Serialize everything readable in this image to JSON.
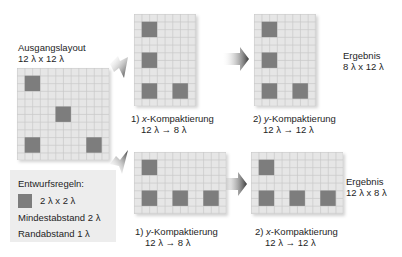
{
  "colors": {
    "grid_background": "#e6e6e6",
    "grid_line": "#c9c9c9",
    "block": "#7d7d7d",
    "rules_box": "#ededed",
    "arrow": "#4a4a4a"
  },
  "original": {
    "title": "Ausgangslayout",
    "size": "12 λ x 12 λ",
    "cols": 12,
    "rows": 12,
    "blocks": [
      [
        1,
        1
      ],
      [
        5,
        5
      ],
      [
        1,
        9
      ],
      [
        9,
        9
      ]
    ]
  },
  "top_path": {
    "step1": {
      "number": "1)",
      "axis": "x",
      "label": "-Kompaktierung",
      "change": "12 λ → 8 λ",
      "cols": 8,
      "rows": 12,
      "blocks": [
        [
          1,
          1
        ],
        [
          1,
          5
        ],
        [
          1,
          9
        ],
        [
          5,
          9
        ]
      ]
    },
    "step2": {
      "number": "2)",
      "axis": "y",
      "label": "-Kompaktierung",
      "change": "12 λ → 12 λ",
      "cols": 8,
      "rows": 12,
      "blocks": [
        [
          1,
          1
        ],
        [
          1,
          5
        ],
        [
          1,
          9
        ],
        [
          5,
          9
        ]
      ]
    },
    "result": {
      "title": "Ergebnis",
      "size": "8 λ x 12 λ"
    }
  },
  "bottom_path": {
    "step1": {
      "number": "1)",
      "axis": "y",
      "label": "-Kompaktierung",
      "change": "12 λ → 8 λ",
      "cols": 12,
      "rows": 8,
      "blocks": [
        [
          1,
          1
        ],
        [
          1,
          5
        ],
        [
          5,
          5
        ],
        [
          9,
          5
        ]
      ]
    },
    "step2": {
      "number": "2)",
      "axis": "x",
      "label": "-Kompaktierung",
      "change": "12 λ → 12 λ",
      "cols": 12,
      "rows": 8,
      "blocks": [
        [
          1,
          1
        ],
        [
          1,
          5
        ],
        [
          5,
          5
        ],
        [
          9,
          5
        ]
      ]
    },
    "result": {
      "title": "Ergebnis",
      "size": "12 λ x 8 λ"
    }
  },
  "rules": {
    "title": "Entwurfsregeln:",
    "block_size": "2 λ x 2 λ",
    "min_spacing": "Mindestabstand 2 λ",
    "border_spacing": "Randabstand 1 λ"
  }
}
